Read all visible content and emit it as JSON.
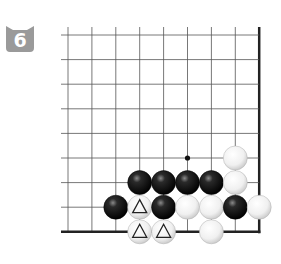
{
  "problem": {
    "number": "6",
    "badge_color": "#9a9a9a",
    "badge_text_color": "#ffffff"
  },
  "board": {
    "columns": 9,
    "rows": 9,
    "edges": [
      "right",
      "bottom"
    ],
    "line_color": "#555555",
    "edge_color": "#222222",
    "marker_dot": {
      "col": 5,
      "row": 5
    }
  },
  "stones": [
    {
      "color": "white",
      "col": 7,
      "row": 5,
      "mark": ""
    },
    {
      "color": "black",
      "col": 3,
      "row": 6,
      "mark": ""
    },
    {
      "color": "black",
      "col": 4,
      "row": 6,
      "mark": ""
    },
    {
      "color": "black",
      "col": 5,
      "row": 6,
      "mark": ""
    },
    {
      "color": "black",
      "col": 6,
      "row": 6,
      "mark": ""
    },
    {
      "color": "white",
      "col": 7,
      "row": 6,
      "mark": ""
    },
    {
      "color": "black",
      "col": 2,
      "row": 7,
      "mark": ""
    },
    {
      "color": "white",
      "col": 3,
      "row": 7,
      "mark": "triangle"
    },
    {
      "color": "black",
      "col": 4,
      "row": 7,
      "mark": ""
    },
    {
      "color": "white",
      "col": 5,
      "row": 7,
      "mark": ""
    },
    {
      "color": "white",
      "col": 6,
      "row": 7,
      "mark": ""
    },
    {
      "color": "black",
      "col": 7,
      "row": 7,
      "mark": ""
    },
    {
      "color": "white",
      "col": 8,
      "row": 7,
      "mark": ""
    },
    {
      "color": "white",
      "col": 3,
      "row": 8,
      "mark": "triangle"
    },
    {
      "color": "white",
      "col": 4,
      "row": 8,
      "mark": "triangle"
    },
    {
      "color": "white",
      "col": 6,
      "row": 8,
      "mark": ""
    }
  ]
}
